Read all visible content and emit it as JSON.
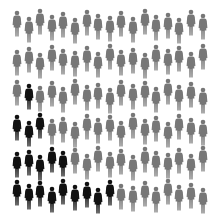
{
  "infographic": {
    "description": "Grid of human silhouettes; black figures highlighted among gray",
    "colors": {
      "default": "#777777",
      "highlight": "#111111",
      "background": "#ffffff"
    },
    "icon": "person-icon",
    "rows": 6,
    "columns": 17,
    "total_figures": 102,
    "highlighted_count": 18,
    "highlighted_per_row": [
      0,
      0,
      1,
      3,
      5,
      9
    ],
    "grid": [
      {
        "y": 10,
        "highlight": []
      },
      {
        "y": 45,
        "highlight": []
      },
      {
        "y": 80,
        "highlight": [
          1
        ]
      },
      {
        "y": 114,
        "highlight": [
          0,
          1,
          2
        ]
      },
      {
        "y": 147,
        "highlight": [
          0,
          1,
          2,
          3,
          4
        ]
      },
      {
        "y": 180,
        "highlight": [
          0,
          1,
          2,
          3,
          4,
          5,
          6,
          7,
          8
        ]
      }
    ],
    "x_start": 12,
    "x_step": 11.6,
    "y_jitter": [
      0,
      6,
      -2,
      4,
      1,
      7,
      -1,
      3,
      5,
      0,
      6,
      -2,
      4,
      2,
      7,
      -1,
      3
    ]
  }
}
